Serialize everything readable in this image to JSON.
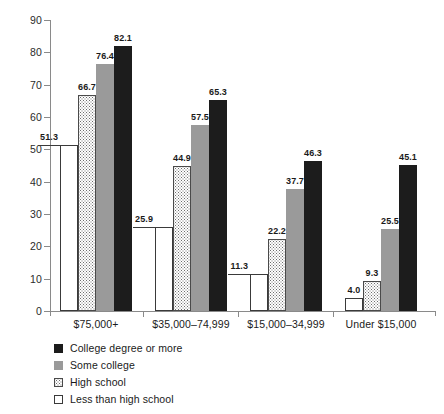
{
  "chart_data": {
    "type": "bar",
    "title": "",
    "xlabel": "",
    "ylabel": "",
    "ylim": [
      0,
      90
    ],
    "ytick_step": 10,
    "yticks": [
      0,
      10,
      20,
      30,
      40,
      50,
      60,
      70,
      80,
      90
    ],
    "grid": false,
    "legend_position": "bottom-left",
    "categories": [
      "$75,000+",
      "$35,000–74,999",
      "$15,000–34,999",
      "Under $15,000"
    ],
    "series": [
      {
        "name": "Less than high school",
        "fill": "white",
        "color": "#ffffff",
        "values": [
          51.3,
          25.9,
          11.3,
          4.0
        ],
        "labels": [
          "51.3",
          "25.9",
          "11.3",
          "4.0"
        ]
      },
      {
        "name": "High school",
        "fill": "dotted",
        "color": "#ffffff",
        "values": [
          66.7,
          44.9,
          22.2,
          9.3
        ],
        "labels": [
          "66.7",
          "44.9",
          "22.2",
          "9.3"
        ]
      },
      {
        "name": "Some college",
        "fill": "gray",
        "color": "#9a9a9a",
        "values": [
          76.4,
          57.5,
          37.7,
          25.5
        ],
        "labels": [
          "76.4",
          "57.5",
          "37.7",
          "25.5"
        ]
      },
      {
        "name": "College degree or more",
        "fill": "black",
        "color": "#1c1c1c",
        "values": [
          82.1,
          65.3,
          46.3,
          45.1
        ],
        "labels": [
          "82.1",
          "65.3",
          "46.3",
          "45.1"
        ]
      }
    ]
  },
  "legend": {
    "items": [
      {
        "label": "College degree or more",
        "swatch": "black"
      },
      {
        "label": "Some college",
        "swatch": "gray"
      },
      {
        "label": "High school",
        "swatch": "dotted"
      },
      {
        "label": "Less than high school",
        "swatch": "white"
      }
    ]
  }
}
